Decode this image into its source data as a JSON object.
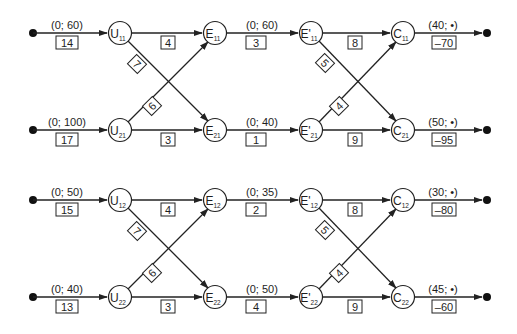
{
  "colors": {
    "line": "#222222",
    "node_fill": "#ffffff",
    "text": "#1e1e1e"
  },
  "blocks": [
    {
      "id": "block-1",
      "sources": [
        {
          "bounds": "(0; 60)",
          "cost": "14",
          "node": "U",
          "sub": "11"
        },
        {
          "bounds": "(0; 100)",
          "cost": "17",
          "node": "U",
          "sub": "21"
        }
      ],
      "u_to_e": {
        "straight_top": "4",
        "straight_bottom": "3",
        "diag_down": "7",
        "diag_up": "6"
      },
      "e_nodes": [
        {
          "node": "E",
          "sub": "11"
        },
        {
          "node": "E",
          "sub": "21"
        }
      ],
      "e_to_e2": [
        {
          "bounds": "(0; 60)",
          "cost": "3"
        },
        {
          "bounds": "(0; 40)",
          "cost": "1"
        }
      ],
      "e2_nodes": [
        {
          "node": "E'",
          "sub": "11"
        },
        {
          "node": "E'",
          "sub": "21"
        }
      ],
      "e2_to_c": {
        "straight_top": "8",
        "straight_bottom": "9",
        "diag_down": "5",
        "diag_up": "4"
      },
      "c_nodes": [
        {
          "node": "C",
          "sub": "11"
        },
        {
          "node": "C",
          "sub": "21"
        }
      ],
      "sinks": [
        {
          "bounds": "(40; •)",
          "cost": "–70"
        },
        {
          "bounds": "(50; •)",
          "cost": "–95"
        }
      ]
    },
    {
      "id": "block-2",
      "sources": [
        {
          "bounds": "(0; 50)",
          "cost": "15",
          "node": "U",
          "sub": "12"
        },
        {
          "bounds": "(0; 40)",
          "cost": "13",
          "node": "U",
          "sub": "22"
        }
      ],
      "u_to_e": {
        "straight_top": "4",
        "straight_bottom": "3",
        "diag_down": "7",
        "diag_up": "6"
      },
      "e_nodes": [
        {
          "node": "E",
          "sub": "12"
        },
        {
          "node": "E",
          "sub": "22"
        }
      ],
      "e_to_e2": [
        {
          "bounds": "(0; 35)",
          "cost": "2"
        },
        {
          "bounds": "(0; 50)",
          "cost": "4"
        }
      ],
      "e2_nodes": [
        {
          "node": "E'",
          "sub": "12"
        },
        {
          "node": "E'",
          "sub": "22"
        }
      ],
      "e2_to_c": {
        "straight_top": "8",
        "straight_bottom": "9",
        "diag_down": "5",
        "diag_up": "4"
      },
      "c_nodes": [
        {
          "node": "C",
          "sub": "12"
        },
        {
          "node": "C",
          "sub": "22"
        }
      ],
      "sinks": [
        {
          "bounds": "(30; •)",
          "cost": "–80"
        },
        {
          "bounds": "(45; •)",
          "cost": "–60"
        }
      ]
    }
  ]
}
